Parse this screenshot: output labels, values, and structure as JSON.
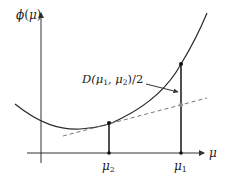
{
  "diagram": {
    "type": "convex-function-bregman-illustration",
    "y_axis_label": {
      "base": "ϕ",
      "arg": "μ",
      "text": "ϕ(μ)"
    },
    "x_axis_label": "μ",
    "x_ticks": [
      {
        "name": "mu2",
        "base": "μ",
        "sub": "2",
        "x": 109
      },
      {
        "name": "mu1",
        "base": "μ",
        "sub": "1",
        "x": 181
      }
    ],
    "annotation": {
      "prefix": "D(μ",
      "sub1": "1",
      "mid": ", μ",
      "sub2": "2",
      "suffix": ")/2",
      "text": "D(μ1, μ2)/2"
    },
    "colors": {
      "curve": "#2a2a2a",
      "axes": "#333333",
      "tangent": "#777777",
      "point": "#111111",
      "tangent_point": "#888888"
    }
  }
}
